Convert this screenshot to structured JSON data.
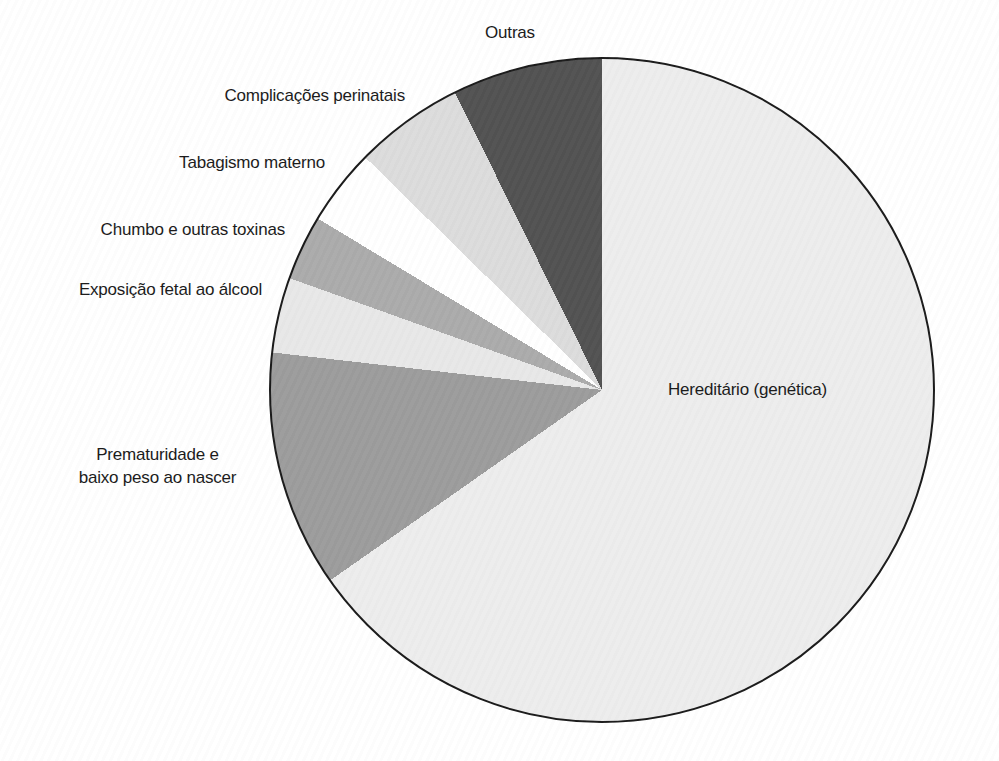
{
  "page": {
    "background_color": "#ffffff",
    "text_color": "#1a1a1a"
  },
  "chart_data": {
    "type": "pie",
    "title": "",
    "legend": "none",
    "start_angle": "top",
    "slice_listing_direction": "counterclockwise-from-top",
    "outline_color": "#1a1a1a",
    "slices": [
      {
        "label": "Outras",
        "color": "#525252",
        "angle_deg": 26.3,
        "percent_est": 7.3
      },
      {
        "label": "Complicações perinatais",
        "color": "#dcdcdc",
        "angle_deg": 19.2,
        "percent_est": 5.3
      },
      {
        "label": "Tabagismo materno",
        "color": "#ffffff",
        "angle_deg": 13.4,
        "percent_est": 3.7
      },
      {
        "label": "Chumbo e outras toxinas",
        "color": "#ababab",
        "angle_deg": 11.4,
        "percent_est": 3.2
      },
      {
        "label": "Exposição fetal ao álcool",
        "color": "#e8e8e8",
        "angle_deg": 13.2,
        "percent_est": 3.7
      },
      {
        "label": "Prematuridade e baixo peso ao nascer",
        "label_lines": [
          "Prematuridade e",
          "baixo peso ao nascer"
        ],
        "color": "#9c9c9c",
        "angle_deg": 41.5,
        "percent_est": 11.5
      },
      {
        "label": "Hereditário (genética)",
        "color": "#ededed",
        "angle_deg": 235.0,
        "percent_est": 65.3
      }
    ]
  }
}
